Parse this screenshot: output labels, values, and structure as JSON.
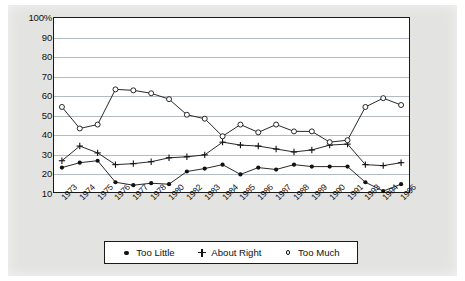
{
  "chart_data": {
    "type": "line",
    "title": "",
    "subtitle": "",
    "xlabel": "",
    "ylabel": "",
    "ylim": [
      10,
      100
    ],
    "ytick_labels": [
      "100%",
      "90",
      "80",
      "70",
      "60",
      "50",
      "40",
      "30",
      "20",
      "10"
    ],
    "yticks": [
      100,
      90,
      80,
      70,
      60,
      50,
      40,
      30,
      20,
      10
    ],
    "grid": true,
    "legend_position": "bottom",
    "categories": [
      "1973",
      "1974",
      "1975",
      "1976",
      "1977",
      "1978",
      "1980",
      "1982",
      "1983",
      "1984",
      "1985",
      "1986",
      "1987",
      "1988",
      "1989",
      "1990",
      "1991",
      "1993",
      "1994",
      "1996"
    ],
    "series": [
      {
        "name": "Too Little",
        "marker": "filled-circle",
        "values": [
          23,
          25.5,
          26.5,
          15.5,
          14,
          15,
          14.5,
          21,
          22.5,
          24.5,
          19.5,
          23,
          22,
          24.5,
          23.5,
          23.5,
          23.5,
          15.5,
          11,
          14.5
        ]
      },
      {
        "name": "About Right",
        "marker": "plus",
        "values": [
          26.5,
          34,
          30.5,
          24.5,
          25,
          26,
          28,
          28.5,
          29.5,
          36,
          34.5,
          34,
          32.5,
          31,
          32,
          34.5,
          35,
          24.5,
          24,
          25.5
        ]
      },
      {
        "name": "Too Much",
        "marker": "open-circle",
        "values": [
          54,
          43,
          45,
          63,
          62.5,
          61,
          58,
          50,
          48,
          39,
          45,
          41,
          45,
          41.5,
          41.5,
          36,
          37,
          54,
          58.5,
          55
        ]
      }
    ]
  },
  "legend": {
    "items": [
      {
        "label": "Too Little",
        "marker": "filled-circle"
      },
      {
        "label": "About Right",
        "marker": "plus"
      },
      {
        "label": "Too Much",
        "marker": "open-circle"
      }
    ]
  },
  "colors": {
    "ink": "#111111",
    "grid": "#9aa3ad",
    "page_background": "#e3e3e1",
    "plot_background": "#ffffff"
  }
}
